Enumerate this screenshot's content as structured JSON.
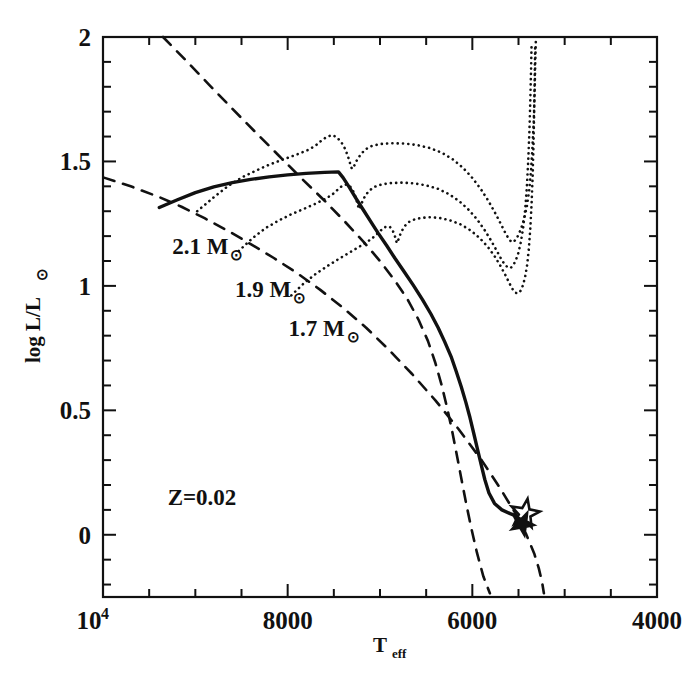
{
  "figure": {
    "kind": "hertzsprung-russell-diagram",
    "background": "#ffffff",
    "ink": "#111111"
  },
  "chart_data": {
    "type": "line",
    "title": "",
    "xlabel": "T_eff",
    "ylabel": "log L/L⊙",
    "xlabel_display": "T",
    "xlabel_sub": "eff",
    "ylabel_display": "log L/L",
    "ylabel_sun": "⊙",
    "xlim": [
      10000,
      4000
    ],
    "ylim": [
      -0.25,
      2.0
    ],
    "x_inverted": true,
    "grid": false,
    "legend": false,
    "xticks": [
      10000,
      8000,
      6000,
      4000
    ],
    "xticklabels": [
      "10⁴",
      "8000",
      "6000",
      "4000"
    ],
    "xtick_base": "10",
    "xtick_exp": "4",
    "xminor_step": 500,
    "yticks": [
      0,
      0.5,
      1,
      1.5,
      2
    ],
    "yticklabels": [
      "0",
      "0.5",
      "1",
      "1.5",
      "2"
    ],
    "yminor_step": 0.1,
    "annotations": [
      {
        "name": "metallicity",
        "text": "Z=0.02",
        "x": 9300,
        "y": 0.12
      },
      {
        "name": "mass-label-2.1",
        "text": "2.1 M",
        "sun": "⊙",
        "x": 9250,
        "y": 1.13
      },
      {
        "name": "mass-label-1.9",
        "text": "1.9 M",
        "sun": "⊙",
        "x": 8570,
        "y": 0.955
      },
      {
        "name": "mass-label-1.7",
        "text": "1.7 M",
        "sun": "⊙",
        "x": 7990,
        "y": 0.8
      }
    ],
    "markers": [
      {
        "name": "observed-star-open",
        "symbol": "open-star",
        "x": 5430,
        "y": 0.085
      },
      {
        "name": "observed-star-filled",
        "symbol": "filled-star",
        "x": 5460,
        "y": 0.045
      }
    ],
    "series": [
      {
        "name": "isochrone-solid",
        "label": "isochrone",
        "style": "solid-thick",
        "linewidth": 3.4,
        "points": [
          [
            9390,
            1.315
          ],
          [
            9200,
            1.345
          ],
          [
            9000,
            1.375
          ],
          [
            8800,
            1.398
          ],
          [
            8600,
            1.415
          ],
          [
            8400,
            1.428
          ],
          [
            8200,
            1.438
          ],
          [
            8000,
            1.446
          ],
          [
            7800,
            1.452
          ],
          [
            7600,
            1.456
          ],
          [
            7450,
            1.458
          ],
          [
            7400,
            1.435
          ],
          [
            7330,
            1.395
          ],
          [
            7260,
            1.352
          ],
          [
            7180,
            1.305
          ],
          [
            7100,
            1.258
          ],
          [
            7020,
            1.212
          ],
          [
            6930,
            1.163
          ],
          [
            6840,
            1.112
          ],
          [
            6740,
            1.058
          ],
          [
            6640,
            1.003
          ],
          [
            6540,
            0.945
          ],
          [
            6450,
            0.888
          ],
          [
            6370,
            0.832
          ],
          [
            6300,
            0.776
          ],
          [
            6230,
            0.716
          ],
          [
            6175,
            0.657
          ],
          [
            6120,
            0.595
          ],
          [
            6070,
            0.532
          ],
          [
            6025,
            0.47
          ],
          [
            5985,
            0.408
          ],
          [
            5945,
            0.345
          ],
          [
            5905,
            0.283
          ],
          [
            5865,
            0.222
          ],
          [
            5820,
            0.168
          ],
          [
            5760,
            0.126
          ],
          [
            5680,
            0.1
          ],
          [
            5590,
            0.085
          ],
          [
            5500,
            0.072
          ],
          [
            5430,
            0.06
          ]
        ]
      },
      {
        "name": "zams-dashed-upper",
        "label": "dashed reference line A",
        "style": "dashed",
        "linewidth": 2.6,
        "points": [
          [
            9990,
            1.435
          ],
          [
            9700,
            1.4
          ],
          [
            9400,
            1.358
          ],
          [
            9150,
            1.318
          ],
          [
            8900,
            1.272
          ],
          [
            8650,
            1.222
          ],
          [
            8400,
            1.168
          ],
          [
            8150,
            1.112
          ],
          [
            7900,
            1.052
          ],
          [
            7650,
            0.985
          ],
          [
            7400,
            0.912
          ],
          [
            7150,
            0.832
          ],
          [
            6900,
            0.742
          ],
          [
            6650,
            0.645
          ],
          [
            6400,
            0.54
          ],
          [
            6150,
            0.425
          ],
          [
            5900,
            0.3
          ],
          [
            5700,
            0.188
          ],
          [
            5540,
            0.09
          ],
          [
            5420,
            0.005
          ],
          [
            5330,
            -0.075
          ],
          [
            5280,
            -0.135
          ],
          [
            5245,
            -0.19
          ],
          [
            5225,
            -0.235
          ]
        ]
      },
      {
        "name": "zams-dashed-lower",
        "label": "dashed reference line B",
        "style": "dashed",
        "linewidth": 2.6,
        "points": [
          [
            9350,
            2.0
          ],
          [
            9100,
            1.905
          ],
          [
            8850,
            1.808
          ],
          [
            8600,
            1.712
          ],
          [
            8350,
            1.618
          ],
          [
            8100,
            1.525
          ],
          [
            7850,
            1.432
          ],
          [
            7600,
            1.342
          ],
          [
            7380,
            1.258
          ],
          [
            7180,
            1.178
          ],
          [
            7000,
            1.1
          ],
          [
            6840,
            1.022
          ],
          [
            6700,
            0.945
          ],
          [
            6580,
            0.862
          ],
          [
            6480,
            0.778
          ],
          [
            6400,
            0.69
          ],
          [
            6330,
            0.598
          ],
          [
            6270,
            0.505
          ],
          [
            6215,
            0.41
          ],
          [
            6165,
            0.315
          ],
          [
            6115,
            0.218
          ],
          [
            6065,
            0.122
          ],
          [
            6010,
            0.025
          ],
          [
            5950,
            -0.072
          ],
          [
            5880,
            -0.168
          ],
          [
            5810,
            -0.235
          ]
        ]
      },
      {
        "name": "evolutionary-track-2.1",
        "label": "2.1 M⊙ track",
        "style": "dotted",
        "linewidth": 2.6,
        "points": [
          [
            8980,
            1.3
          ],
          [
            8800,
            1.356
          ],
          [
            8650,
            1.4
          ],
          [
            8500,
            1.435
          ],
          [
            8350,
            1.462
          ],
          [
            8200,
            1.487
          ],
          [
            8050,
            1.508
          ],
          [
            7900,
            1.528
          ],
          [
            7780,
            1.546
          ],
          [
            7700,
            1.563
          ],
          [
            7640,
            1.582
          ],
          [
            7580,
            1.598
          ],
          [
            7520,
            1.606
          ],
          [
            7470,
            1.598
          ],
          [
            7420,
            1.578
          ],
          [
            7380,
            1.552
          ],
          [
            7350,
            1.524
          ],
          [
            7330,
            1.5
          ],
          [
            7315,
            1.478
          ],
          [
            7300,
            1.47
          ],
          [
            7280,
            1.482
          ],
          [
            7250,
            1.505
          ],
          [
            7210,
            1.528
          ],
          [
            7160,
            1.548
          ],
          [
            7090,
            1.562
          ],
          [
            7000,
            1.57
          ],
          [
            6880,
            1.573
          ],
          [
            6740,
            1.572
          ],
          [
            6600,
            1.566
          ],
          [
            6460,
            1.554
          ],
          [
            6330,
            1.535
          ],
          [
            6210,
            1.508
          ],
          [
            6100,
            1.474
          ],
          [
            6000,
            1.434
          ],
          [
            5910,
            1.39
          ],
          [
            5830,
            1.344
          ],
          [
            5760,
            1.298
          ],
          [
            5700,
            1.255
          ],
          [
            5650,
            1.218
          ],
          [
            5610,
            1.192
          ],
          [
            5580,
            1.178
          ],
          [
            5555,
            1.176
          ],
          [
            5530,
            1.186
          ],
          [
            5500,
            1.205
          ],
          [
            5470,
            1.232
          ],
          [
            5440,
            1.268
          ],
          [
            5410,
            1.318
          ],
          [
            5385,
            1.382
          ],
          [
            5365,
            1.46
          ],
          [
            5350,
            1.552
          ],
          [
            5335,
            1.66
          ],
          [
            5325,
            1.78
          ],
          [
            5318,
            1.9
          ],
          [
            5312,
            1.99
          ]
        ]
      },
      {
        "name": "evolutionary-track-1.9",
        "label": "1.9 M⊙ track",
        "style": "dotted",
        "linewidth": 2.6,
        "points": [
          [
            8530,
            1.14
          ],
          [
            8380,
            1.192
          ],
          [
            8240,
            1.232
          ],
          [
            8100,
            1.262
          ],
          [
            7960,
            1.288
          ],
          [
            7820,
            1.31
          ],
          [
            7700,
            1.33
          ],
          [
            7600,
            1.348
          ],
          [
            7520,
            1.366
          ],
          [
            7460,
            1.386
          ],
          [
            7410,
            1.402
          ],
          [
            7360,
            1.408
          ],
          [
            7320,
            1.398
          ],
          [
            7290,
            1.38
          ],
          [
            7265,
            1.358
          ],
          [
            7248,
            1.336
          ],
          [
            7235,
            1.318
          ],
          [
            7225,
            1.308
          ],
          [
            7212,
            1.318
          ],
          [
            7190,
            1.34
          ],
          [
            7160,
            1.362
          ],
          [
            7120,
            1.382
          ],
          [
            7060,
            1.398
          ],
          [
            6980,
            1.408
          ],
          [
            6880,
            1.413
          ],
          [
            6760,
            1.415
          ],
          [
            6630,
            1.412
          ],
          [
            6500,
            1.404
          ],
          [
            6370,
            1.39
          ],
          [
            6250,
            1.368
          ],
          [
            6140,
            1.34
          ],
          [
            6040,
            1.306
          ],
          [
            5950,
            1.268
          ],
          [
            5870,
            1.226
          ],
          [
            5800,
            1.184
          ],
          [
            5740,
            1.144
          ],
          [
            5690,
            1.11
          ],
          [
            5650,
            1.086
          ],
          [
            5615,
            1.074
          ],
          [
            5585,
            1.072
          ],
          [
            5558,
            1.082
          ],
          [
            5530,
            1.102
          ],
          [
            5502,
            1.132
          ],
          [
            5475,
            1.175
          ],
          [
            5450,
            1.232
          ],
          [
            5428,
            1.305
          ],
          [
            5410,
            1.395
          ],
          [
            5395,
            1.5
          ],
          [
            5382,
            1.62
          ],
          [
            5372,
            1.748
          ],
          [
            5364,
            1.87
          ],
          [
            5358,
            1.975
          ]
        ]
      },
      {
        "name": "evolutionary-track-1.7",
        "label": "1.7 M⊙ track",
        "style": "dotted",
        "linewidth": 2.6,
        "points": [
          [
            7960,
            0.962
          ],
          [
            7820,
            1.012
          ],
          [
            7690,
            1.05
          ],
          [
            7560,
            1.082
          ],
          [
            7440,
            1.11
          ],
          [
            7330,
            1.134
          ],
          [
            7230,
            1.156
          ],
          [
            7140,
            1.176
          ],
          [
            7070,
            1.196
          ],
          [
            7010,
            1.216
          ],
          [
            6965,
            1.232
          ],
          [
            6925,
            1.24
          ],
          [
            6890,
            1.236
          ],
          [
            6862,
            1.222
          ],
          [
            6842,
            1.204
          ],
          [
            6828,
            1.186
          ],
          [
            6818,
            1.172
          ],
          [
            6806,
            1.18
          ],
          [
            6788,
            1.2
          ],
          [
            6762,
            1.222
          ],
          [
            6728,
            1.242
          ],
          [
            6682,
            1.258
          ],
          [
            6620,
            1.268
          ],
          [
            6540,
            1.274
          ],
          [
            6445,
            1.276
          ],
          [
            6340,
            1.272
          ],
          [
            6230,
            1.262
          ],
          [
            6120,
            1.246
          ],
          [
            6015,
            1.222
          ],
          [
            5920,
            1.192
          ],
          [
            5835,
            1.158
          ],
          [
            5760,
            1.12
          ],
          [
            5695,
            1.08
          ],
          [
            5640,
            1.042
          ],
          [
            5595,
            1.008
          ],
          [
            5560,
            0.984
          ],
          [
            5530,
            0.972
          ],
          [
            5503,
            0.97
          ],
          [
            5478,
            0.98
          ],
          [
            5452,
            1.002
          ],
          [
            5428,
            1.036
          ],
          [
            5406,
            1.085
          ],
          [
            5388,
            1.15
          ],
          [
            5372,
            1.232
          ],
          [
            5358,
            1.332
          ],
          [
            5346,
            1.448
          ],
          [
            5337,
            1.575
          ],
          [
            5330,
            1.71
          ],
          [
            5324,
            1.845
          ],
          [
            5320,
            1.96
          ]
        ]
      }
    ]
  },
  "axis_frame": {
    "name": "plot-frame",
    "left_px": 103,
    "right_px": 657,
    "top_px": 37,
    "bottom_px": 597
  }
}
